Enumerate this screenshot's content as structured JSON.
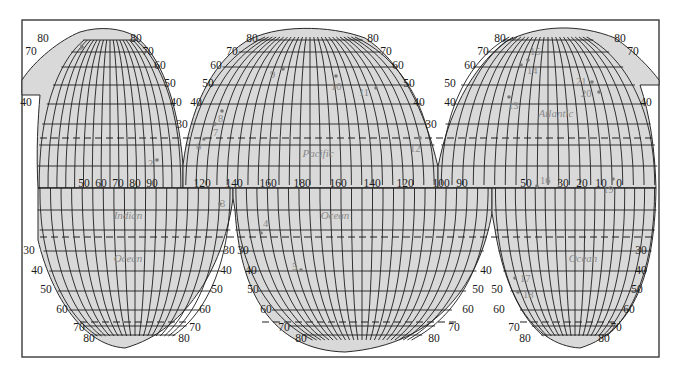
{
  "map": {
    "projection": "interrupted equal-area (Goode homolosine style)",
    "colors": {
      "land_fill": "#d9d9d9",
      "grid": "#1e1e1e",
      "labels": "#1a1a1a",
      "ocean_labels": "#8a8a8a",
      "points": "#7a7a7a"
    },
    "ocean_labels": [
      {
        "id": "indian",
        "text": "Indian",
        "x": 128,
        "y": 219
      },
      {
        "id": "indian-ocean",
        "text": "Ocean",
        "x": 128,
        "y": 262
      },
      {
        "id": "pacific",
        "text": "Pacific",
        "x": 318,
        "y": 157
      },
      {
        "id": "pacific-ocean",
        "text": "Ocean",
        "x": 335,
        "y": 219
      },
      {
        "id": "atlantic",
        "text": "Atlantic",
        "x": 556,
        "y": 117
      },
      {
        "id": "atlantic-ocean",
        "text": "Ocean",
        "x": 583,
        "y": 262
      }
    ],
    "longitude_labels": [
      {
        "text": "50",
        "x": 84,
        "y": 187
      },
      {
        "text": "60",
        "x": 101,
        "y": 187
      },
      {
        "text": "70",
        "x": 118,
        "y": 187
      },
      {
        "text": "80",
        "x": 135,
        "y": 187
      },
      {
        "text": "90",
        "x": 152,
        "y": 187
      },
      {
        "text": "120",
        "x": 202,
        "y": 187
      },
      {
        "text": "140",
        "x": 234,
        "y": 187
      },
      {
        "text": "160",
        "x": 268,
        "y": 187
      },
      {
        "text": "180",
        "x": 302,
        "y": 187
      },
      {
        "text": "160",
        "x": 338,
        "y": 187
      },
      {
        "text": "140",
        "x": 372,
        "y": 187
      },
      {
        "text": "120",
        "x": 405,
        "y": 187
      },
      {
        "text": "100",
        "x": 441,
        "y": 187
      },
      {
        "text": "90",
        "x": 462,
        "y": 187
      },
      {
        "text": "50",
        "x": 526,
        "y": 187
      },
      {
        "text": "30",
        "x": 563,
        "y": 187
      },
      {
        "text": "20",
        "x": 582,
        "y": 187
      },
      {
        "text": "10",
        "x": 601,
        "y": 187
      },
      {
        "text": "0",
        "x": 619,
        "y": 187
      }
    ],
    "latitude_labels": [
      {
        "text": "80",
        "x": 43,
        "y": 42
      },
      {
        "text": "80",
        "x": 136,
        "y": 42
      },
      {
        "text": "70",
        "x": 31,
        "y": 55
      },
      {
        "text": "70",
        "x": 148,
        "y": 55
      },
      {
        "text": "60",
        "x": 160,
        "y": 69
      },
      {
        "text": "50",
        "x": 170,
        "y": 87
      },
      {
        "text": "40",
        "x": 26,
        "y": 106
      },
      {
        "text": "40",
        "x": 176,
        "y": 106
      },
      {
        "text": "30",
        "x": 182,
        "y": 128
      },
      {
        "text": "70",
        "x": 232,
        "y": 55
      },
      {
        "text": "60",
        "x": 216,
        "y": 69
      },
      {
        "text": "50",
        "x": 208,
        "y": 87
      },
      {
        "text": "40",
        "x": 196,
        "y": 106
      },
      {
        "text": "80",
        "x": 252,
        "y": 42
      },
      {
        "text": "80",
        "x": 373,
        "y": 42
      },
      {
        "text": "70",
        "x": 386,
        "y": 55
      },
      {
        "text": "60",
        "x": 398,
        "y": 69
      },
      {
        "text": "50",
        "x": 409,
        "y": 87
      },
      {
        "text": "40",
        "x": 419,
        "y": 106
      },
      {
        "text": "30",
        "x": 431,
        "y": 128
      },
      {
        "text": "50",
        "x": 450,
        "y": 87
      },
      {
        "text": "40",
        "x": 450,
        "y": 106
      },
      {
        "text": "80",
        "x": 500,
        "y": 42
      },
      {
        "text": "80",
        "x": 620,
        "y": 42
      },
      {
        "text": "70",
        "x": 483,
        "y": 55
      },
      {
        "text": "70",
        "x": 633,
        "y": 55
      },
      {
        "text": "60",
        "x": 470,
        "y": 69
      },
      {
        "text": "40",
        "x": 646,
        "y": 106
      },
      {
        "text": "30",
        "x": 29,
        "y": 254
      },
      {
        "text": "40",
        "x": 37,
        "y": 274
      },
      {
        "text": "50",
        "x": 46,
        "y": 293
      },
      {
        "text": "60",
        "x": 62,
        "y": 313
      },
      {
        "text": "70",
        "x": 79,
        "y": 331
      },
      {
        "text": "80",
        "x": 89,
        "y": 342
      },
      {
        "text": "30",
        "x": 229,
        "y": 254
      },
      {
        "text": "40",
        "x": 226,
        "y": 274
      },
      {
        "text": "50",
        "x": 217,
        "y": 293
      },
      {
        "text": "60",
        "x": 205,
        "y": 313
      },
      {
        "text": "70",
        "x": 195,
        "y": 331
      },
      {
        "text": "80",
        "x": 184,
        "y": 342
      },
      {
        "text": "30",
        "x": 243,
        "y": 254
      },
      {
        "text": "40",
        "x": 251,
        "y": 274
      },
      {
        "text": "50",
        "x": 253,
        "y": 293
      },
      {
        "text": "60",
        "x": 266,
        "y": 313
      },
      {
        "text": "70",
        "x": 284,
        "y": 331
      },
      {
        "text": "80",
        "x": 301,
        "y": 342
      },
      {
        "text": "40",
        "x": 486,
        "y": 274
      },
      {
        "text": "50",
        "x": 478,
        "y": 293
      },
      {
        "text": "60",
        "x": 468,
        "y": 313
      },
      {
        "text": "70",
        "x": 454,
        "y": 331
      },
      {
        "text": "80",
        "x": 434,
        "y": 342
      },
      {
        "text": "50",
        "x": 497,
        "y": 293
      },
      {
        "text": "60",
        "x": 499,
        "y": 313
      },
      {
        "text": "70",
        "x": 514,
        "y": 331
      },
      {
        "text": "80",
        "x": 525,
        "y": 342
      },
      {
        "text": "30",
        "x": 641,
        "y": 254
      },
      {
        "text": "40",
        "x": 641,
        "y": 274
      },
      {
        "text": "50",
        "x": 637,
        "y": 293
      },
      {
        "text": "60",
        "x": 629,
        "y": 313
      },
      {
        "text": "70",
        "x": 616,
        "y": 331
      },
      {
        "text": "80",
        "x": 604,
        "y": 342
      }
    ],
    "points": [
      {
        "n": "1",
        "x": 82,
        "y": 47,
        "lx": 78,
        "ly": 50
      },
      {
        "n": "2",
        "x": 157,
        "y": 160,
        "lx": 148,
        "ly": 167
      },
      {
        "n": "3",
        "x": 220,
        "y": 204,
        "lx": 220,
        "ly": 207
      },
      {
        "n": "4",
        "x": 261,
        "y": 233,
        "lx": 263,
        "ly": 227
      },
      {
        "n": "5",
        "x": 301,
        "y": 270,
        "lx": 292,
        "ly": 270
      },
      {
        "n": "6",
        "x": 204,
        "y": 139,
        "lx": 196,
        "ly": 150
      },
      {
        "n": "7",
        "x": 215,
        "y": 124,
        "lx": 213,
        "ly": 136
      },
      {
        "n": "8",
        "x": 222,
        "y": 111,
        "lx": 218,
        "ly": 122
      },
      {
        "n": "9",
        "x": 283,
        "y": 69,
        "lx": 270,
        "ly": 78
      },
      {
        "n": "10",
        "x": 336,
        "y": 76,
        "lx": 331,
        "ly": 90
      },
      {
        "n": "11",
        "x": 376,
        "y": 88,
        "lx": 359,
        "ly": 96
      },
      {
        "n": "12",
        "x": 420,
        "y": 138,
        "lx": 410,
        "ly": 152
      },
      {
        "n": "13",
        "x": 509,
        "y": 97,
        "lx": 508,
        "ly": 109
      },
      {
        "n": "14",
        "x": 521,
        "y": 65,
        "lx": 527,
        "ly": 74
      },
      {
        "n": "15",
        "x": 528,
        "y": 60,
        "lx": 530,
        "ly": 55
      },
      {
        "n": "16",
        "x": 537,
        "y": 186,
        "lx": 540,
        "ly": 184
      },
      {
        "n": "17",
        "x": 515,
        "y": 278,
        "lx": 520,
        "ly": 282
      },
      {
        "n": "18",
        "x": 518,
        "y": 292,
        "lx": 523,
        "ly": 298
      },
      {
        "n": "19",
        "x": 613,
        "y": 179,
        "lx": 603,
        "ly": 193
      },
      {
        "n": "20",
        "x": 599,
        "y": 92,
        "lx": 581,
        "ly": 97
      },
      {
        "n": "21",
        "x": 592,
        "y": 82,
        "lx": 576,
        "ly": 85
      }
    ]
  }
}
